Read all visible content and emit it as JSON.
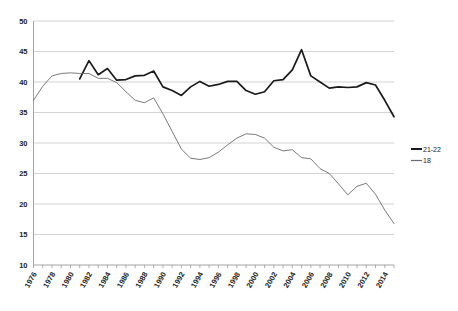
{
  "chart_data": {
    "type": "line",
    "title": "",
    "subtitle": "",
    "xlabel": "",
    "ylabel": "",
    "xlim": [
      1976,
      2015
    ],
    "ylim": [
      10,
      50
    ],
    "grid": true,
    "legend_position": "right",
    "x": [
      1976,
      1977,
      1978,
      1979,
      1980,
      1981,
      1982,
      1983,
      1984,
      1985,
      1986,
      1987,
      1988,
      1989,
      1990,
      1991,
      1992,
      1993,
      1994,
      1995,
      1996,
      1997,
      1998,
      1999,
      2000,
      2001,
      2002,
      2003,
      2004,
      2005,
      2006,
      2007,
      2008,
      2009,
      2010,
      2011,
      2012,
      2013,
      2014,
      2015
    ],
    "xticks": [
      "1976",
      "1978",
      "1980",
      "1982",
      "1984",
      "1986",
      "1988",
      "1990",
      "1992",
      "1994",
      "1996",
      "1998",
      "2000",
      "2002",
      "2004",
      "2006",
      "2008",
      "2010",
      "2012",
      "2014"
    ],
    "yticks": [
      "10",
      "15",
      "20",
      "25",
      "30",
      "35",
      "40",
      "45",
      "50"
    ],
    "series": [
      {
        "name": "21-22",
        "color": "#1a1a1a",
        "width": 1.7,
        "start_year": 1981,
        "values": [
          null,
          null,
          null,
          null,
          null,
          40.5,
          43.5,
          41.2,
          42.2,
          40.3,
          40.4,
          41.0,
          41.1,
          41.8,
          39.2,
          38.6,
          37.8,
          39.2,
          40.1,
          39.3,
          39.6,
          40.1,
          40.1,
          38.6,
          38.0,
          38.4,
          40.2,
          40.4,
          42.0,
          45.3,
          41.0,
          40.0,
          39.0,
          39.2,
          39.1,
          39.2,
          39.9,
          39.5,
          37.0,
          34.3
        ]
      },
      {
        "name": "18",
        "color": "#6b6b6b",
        "width": 0.9,
        "start_year": 1976,
        "values": [
          37.0,
          39.3,
          41.0,
          41.4,
          41.5,
          41.4,
          41.4,
          40.6,
          40.6,
          39.9,
          38.4,
          37.0,
          36.6,
          37.4,
          34.8,
          31.9,
          29.0,
          27.5,
          27.3,
          27.6,
          28.5,
          29.7,
          30.8,
          31.5,
          31.4,
          30.8,
          29.3,
          28.7,
          28.9,
          27.6,
          27.4,
          25.8,
          25.0,
          23.3,
          21.5,
          22.9,
          23.4,
          21.6,
          19.0,
          16.8
        ]
      }
    ]
  },
  "legend": {
    "items": [
      {
        "label": "21-22"
      },
      {
        "label": "18"
      }
    ]
  }
}
